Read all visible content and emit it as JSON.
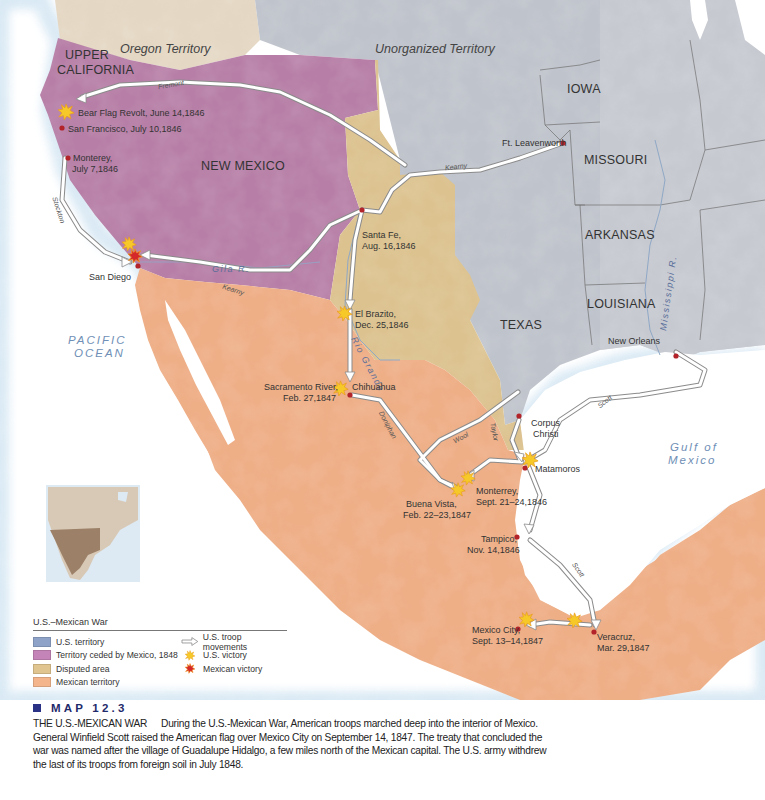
{
  "map": {
    "title": "MAP 12.3",
    "heading": "THE U.S.-MEXICAN WAR",
    "caption": "During the U.S.-Mexican War, American troops marched deep into the interior of Mexico. General Winfield Scott raised the American flag over Mexico City on September 14, 1847. The treaty that concluded the war was named after the village of Guadalupe Hidalgo, a few miles north of the Mexican capital. The U.S. army withdrew the last of its troops from foreign soil in July 1848.",
    "colors": {
      "us_territory": "#a9b3c6",
      "ceded_territory": "#b77fa7",
      "disputed_area": "#dcc28f",
      "mexican_territory": "#eeae86",
      "water": "#ffffff",
      "coast_glow": "#cfe3f2",
      "oregon": "#e4d7c3",
      "unorganized": "#c3c6cc",
      "city_dot": "#b3242a",
      "us_victory": "#f6c928",
      "mexican_victory": "#d4282a",
      "caption_accent": "#2a3285"
    },
    "regions": {
      "oregon_territory": "Oregon Territory",
      "unorganized_territory": "Unorganized Territory",
      "upper_california": [
        "UPPER",
        "CALIFORNIA"
      ],
      "new_mexico": "NEW MEXICO",
      "iowa": "IOWA",
      "missouri": "MISSOURI",
      "arkansas": "ARKANSAS",
      "louisiana": "LOUISIANA",
      "texas": "TEXAS"
    },
    "water_bodies": {
      "pacific": [
        "PACIFIC",
        "OCEAN"
      ],
      "gulf": [
        "Gulf of",
        "Mexico"
      ]
    },
    "rivers": {
      "gila": "Gila R.",
      "rio_grande": "Rio Grande",
      "mississippi": "Mississippi R."
    },
    "routes": {
      "fremont": "Fremont",
      "kearny_north": "Kearny",
      "kearny_south": "Kearny",
      "stockton": "Stockton",
      "doniphan": "Doniphan",
      "wool": "Wool",
      "taylor": "Taylor",
      "scott_gulf": "Scott",
      "scott_south": "Scott"
    },
    "places": {
      "bear_flag": "Bear Flag Revolt, June 14,1846",
      "san_francisco": "San Francisco, July 10,1846",
      "monterey_ca": [
        "Monterey,",
        "July 7,1846"
      ],
      "san_diego": "San Diego",
      "ft_leavenworth": "Ft. Leavenworth",
      "santa_fe": [
        "Santa Fe,",
        "Aug. 16,1846"
      ],
      "el_brazito": [
        "El Brazito,",
        "Dec. 25,1846"
      ],
      "sacramento": [
        "Sacramento River,",
        "Feb. 27,1847"
      ],
      "chihuahua": "Chihuahua",
      "new_orleans": "New Orleans",
      "corpus_christi": [
        "Corpus",
        "Christi"
      ],
      "matamoros": "Matamoros",
      "monterrey": [
        "Monterrey,",
        "Sept. 21–24,1846"
      ],
      "buena_vista": [
        "Buena Vista,",
        "Feb. 22–23,1847"
      ],
      "tampico": [
        "Tampico,",
        "Nov. 14,1846"
      ],
      "mexico_city": [
        "Mexico City,",
        "Sept. 13–14,1847"
      ],
      "veracruz": [
        "Veracruz,",
        "Mar. 29,1847"
      ]
    }
  },
  "legend": {
    "title": "U.S.–Mexican War",
    "items": [
      {
        "label": "U.S. territory",
        "color": "#8fa3c9"
      },
      {
        "label": "Territory ceded by Mexico, 1848",
        "color": "#c584b8"
      },
      {
        "label": "Disputed area",
        "color": "#e1c590"
      },
      {
        "label": "Mexican territory",
        "color": "#f4b58d"
      }
    ],
    "symbols": [
      {
        "label": "U.S. troop movements",
        "icon": "outline-arrow-icon"
      },
      {
        "label": "U.S. victory",
        "icon": "yellow-burst-icon"
      },
      {
        "label": "Mexican victory",
        "icon": "red-burst-icon"
      }
    ]
  }
}
